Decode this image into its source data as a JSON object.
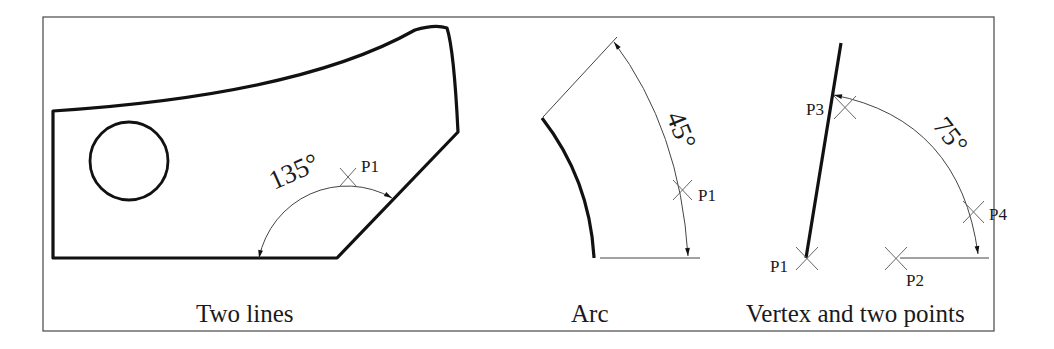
{
  "figure": {
    "panels": [
      {
        "id": "two-lines",
        "caption": "Two lines",
        "angle_label": "135°",
        "points": [
          "P1"
        ]
      },
      {
        "id": "arc",
        "caption": "Arc",
        "angle_label": "45°",
        "points": [
          "P1"
        ]
      },
      {
        "id": "vertex",
        "caption": "Vertex and two points",
        "angle_label": "75°",
        "points": [
          "P1",
          "P2",
          "P3",
          "P4"
        ]
      }
    ]
  },
  "colors": {
    "stroke": "#111111",
    "thin": "#444444",
    "frame": "#555555",
    "background": "#ffffff"
  }
}
